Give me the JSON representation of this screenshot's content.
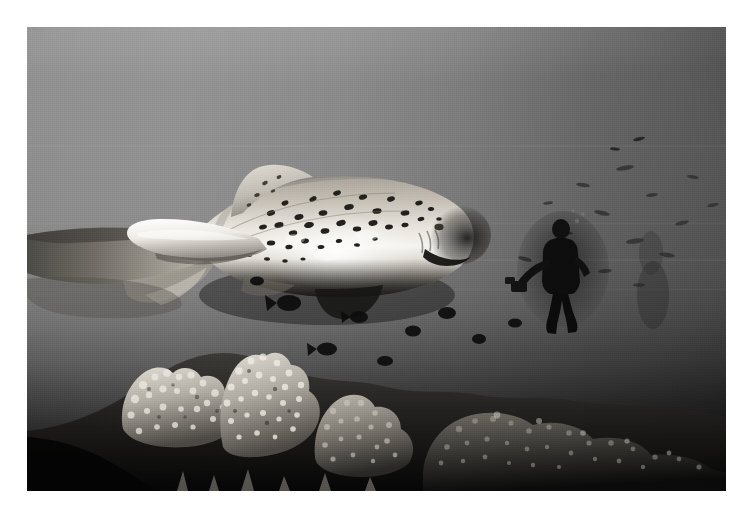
{
  "image": {
    "title": "Zebra shark swimming above a coral reef with scuba diver",
    "medium": "black-and-white underwater photograph",
    "orientation": "landscape",
    "frame": {
      "border_color": "#ffffff",
      "photo_left": 27,
      "photo_top": 27,
      "photo_width": 699,
      "photo_height": 464
    },
    "palette": {
      "water_highlight": "#8d8d8d",
      "water_mid": "#7e7e7e",
      "water_deep": "#333333",
      "abyss": "#070707",
      "shark_belly_highlight": "#f4f2ee",
      "shark_body_mid": "#b9b5ad",
      "shark_spots": "#23211e",
      "coral_light": "#cfcac2",
      "coral_mid": "#7d786f",
      "coral_dark": "#1a1a1a",
      "diver_silhouette": "#141414"
    },
    "subjects": [
      {
        "name": "zebra-shark",
        "description": "large spotted shark, head right, long caudal fin trailing to left edge"
      },
      {
        "name": "scuba-diver",
        "description": "silhouetted diver standing in midwater, right of centre"
      },
      {
        "name": "coral-reef",
        "description": "branching and encrusting corals filling lower third"
      },
      {
        "name": "reef-fish",
        "description": "small dark fish silhouettes drifting over the reef and in open water"
      }
    ],
    "scene_regions": [
      {
        "name": "open-water",
        "tone": "mid grey, brightest at upper left"
      },
      {
        "name": "shark-body",
        "tone": "bright, dense dark spotting along dorsal surface"
      },
      {
        "name": "reef-crest",
        "tone": "textured light grey corals"
      },
      {
        "name": "shadowed-foreground",
        "tone": "near black"
      }
    ]
  }
}
